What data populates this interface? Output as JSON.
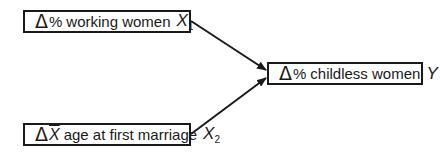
{
  "diagram": {
    "type": "path-diagram",
    "nodes": [
      {
        "id": "x1",
        "delta": "Δ",
        "prefix": "%",
        "label": "working women",
        "var": "X",
        "sub": "1"
      },
      {
        "id": "x2",
        "delta": "Δ",
        "prefix": "X",
        "label": "age at first marriage",
        "var": "X",
        "sub": "2"
      },
      {
        "id": "y",
        "delta": "Δ",
        "prefix": "%",
        "label": "childless women",
        "var": "Y",
        "sub": ""
      }
    ],
    "edges": [
      {
        "from": "x1",
        "to": "y"
      },
      {
        "from": "x2",
        "to": "y"
      }
    ],
    "colors": {
      "stroke": "#1a1a1a",
      "background": "#ffffff"
    }
  }
}
